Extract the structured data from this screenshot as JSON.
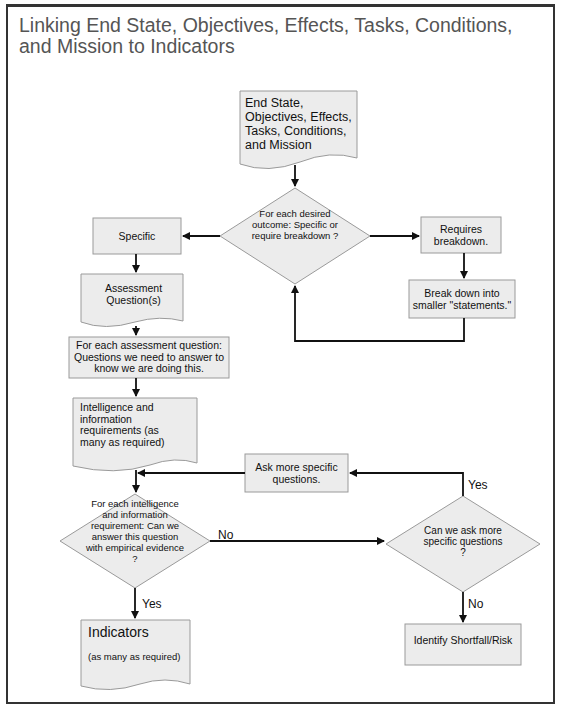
{
  "title": "Linking End State, Objectives, Effects, Tasks, Conditions, and Mission to Indicators",
  "nodes": {
    "start": "End State, Objectives, Effects, Tasks, Conditions, and Mission",
    "decision_outcome": "For each desired outcome: Specific or require breakdown ?",
    "specific": "Specific",
    "requires_breakdown": "Requires breakdown.",
    "break_down": "Break down into smaller \"statements.\"",
    "assessment_questions": "Assessment Question(s)",
    "for_each_question": "For each assessment question: Questions we need to answer to know we are doing this.",
    "intel_requirements": "Intelligence and information requirements (as many as required)",
    "ask_more": "Ask more specific questions.",
    "decision_empirical": "For each intelligence and information requirement: Can we answer this question with empirical evidence ?",
    "decision_ask_more": "Can we ask more specific questions ?",
    "indicators_title": "Indicators",
    "indicators_sub": "(as many as required)",
    "shortfall": "Identify Shortfall/Risk"
  },
  "edge_labels": {
    "empirical_no": "No",
    "empirical_yes": "Yes",
    "ask_more_yes": "Yes",
    "ask_more_no": "No"
  },
  "colors": {
    "node_fill": "#ececec",
    "node_stroke": "#9a9a9a",
    "arrow": "#111111",
    "title": "#555555"
  }
}
